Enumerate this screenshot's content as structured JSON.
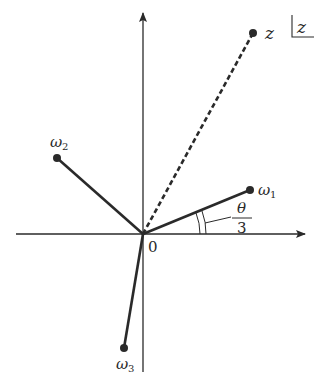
{
  "diagram": {
    "type": "complex-plane",
    "region_label": "z",
    "origin_label": "0",
    "points": [
      {
        "id": "z",
        "label": "z",
        "subscript": "",
        "style": "dashed",
        "x": 253,
        "y": 33
      },
      {
        "id": "w1",
        "label": "ω",
        "subscript": "1",
        "style": "solid",
        "x": 250,
        "y": 190
      },
      {
        "id": "w2",
        "label": "ω",
        "subscript": "2",
        "style": "solid",
        "x": 57,
        "y": 158
      },
      {
        "id": "w3",
        "label": "ω",
        "subscript": "3",
        "style": "solid",
        "x": 124,
        "y": 348
      }
    ],
    "angle_label": {
      "numerator": "θ",
      "denominator": "3"
    },
    "colors": {
      "ink": "#2a2a2a",
      "background": "#ffffff"
    }
  }
}
